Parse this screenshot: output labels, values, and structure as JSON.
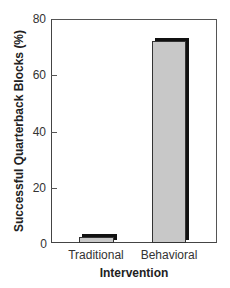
{
  "chart_data": {
    "type": "bar",
    "title": "",
    "xlabel": "Intervention",
    "ylabel": "Successful Quarterback Blocks (%)",
    "categories": [
      "Traditional",
      "Behavioral"
    ],
    "values": [
      2,
      72
    ],
    "ylim": [
      0,
      80
    ],
    "yticks": [
      0,
      20,
      40,
      60,
      80
    ],
    "grid": false,
    "legend": null,
    "bar_color": "#c8c8c8",
    "bar_shadow_color": "#111111"
  },
  "axes": {
    "x_title": "Intervention",
    "y_title": "Successful Quarterback Blocks (%)",
    "y_tick_labels": [
      "0",
      "20",
      "40",
      "60",
      "80"
    ],
    "x_tick_labels": [
      "Traditional",
      "Behavioral"
    ]
  }
}
